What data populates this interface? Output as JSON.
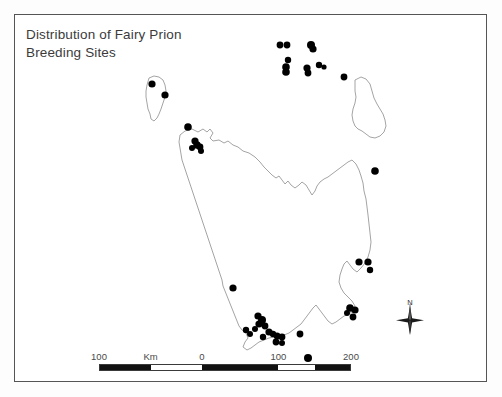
{
  "figure": {
    "title": "Distribution of Fairy Prion\nBreeding Sites",
    "title_line_1": "Distribution of Fairy Prion",
    "title_line_2": "Breeding Sites",
    "frame_color": "#555555",
    "background_color": "#ffffff",
    "coastline_color": "#8d8d8d",
    "site_marker_color": "#000000"
  },
  "scale_bar": {
    "unit_label": "Km",
    "labels": [
      {
        "text": "100",
        "x_pct": 0
      },
      {
        "text": "Km",
        "x_pct": 20.5
      },
      {
        "text": "0",
        "x_pct": 40.8
      },
      {
        "text": "100",
        "x_pct": 71.2
      },
      {
        "text": "200",
        "x_pct": 100
      }
    ],
    "segments": [
      {
        "start_pct": 0,
        "end_pct": 20.5,
        "filled": true
      },
      {
        "start_pct": 20.5,
        "end_pct": 40.8,
        "filled": false
      },
      {
        "start_pct": 40.8,
        "end_pct": 71.2,
        "filled": true
      },
      {
        "start_pct": 71.2,
        "end_pct": 86.0,
        "filled": false
      },
      {
        "start_pct": 86.0,
        "end_pct": 100,
        "filled": true
      }
    ]
  },
  "north_arrow": {
    "label": "N"
  },
  "map": {
    "region": "Tasmania",
    "coastlines": [
      {
        "name": "tasmania-mainland",
        "path": "M 166 121 L 171 117 L 178 115 L 184 118 L 189 115 L 193 118 L 196 115 L 199 119 L 196 124 L 199 127 L 205 126 L 210 129 L 214 127 L 219 131 L 224 133 L 229 137 L 235 139 L 241 143 L 246 148 L 250 153 L 254 157 L 258 161 L 262 164 L 265 162 L 268 166 L 271 170 L 274 167 L 277 171 L 281 174 L 285 171 L 288 168 L 292 171 L 295 176 L 298 181 L 301 177 L 303 172 L 306 168 L 310 165 L 314 163 L 318 160 L 322 157 L 326 154 L 330 151 L 334 148 L 338 146 L 342 150 L 345 156 L 347 162 L 349 169 L 350 177 L 352 185 L 353 193 L 354 201 L 355 210 L 356 219 L 357 228 L 356 236 L 354 243 L 351 249 L 347 254 L 343 258 L 339 255 L 336 251 L 333 247 L 330 250 L 328 255 L 326 261 L 325 268 L 327 274 L 330 279 L 334 283 L 338 287 L 341 292 L 339 297 L 335 300 L 330 302 L 326 305 L 322 308 L 318 310 L 314 307 L 311 303 L 308 299 L 305 295 L 302 291 L 299 294 L 296 298 L 293 302 L 290 306 L 287 310 L 283 313 L 279 316 L 275 319 L 270 321 L 265 322 L 260 323 L 255 324 L 250 326 L 245 328 L 241 331 L 237 334 L 233 336 L 229 333 L 231 328 L 234 324 L 232 319 L 228 316 L 225 312 L 223 307 L 221 302 L 219 297 L 217 292 L 215 287 L 213 282 L 211 277 L 209 272 L 208 266 L 206 260 L 204 254 L 202 248 L 200 242 L 198 236 L 196 230 L 194 224 L 192 218 L 190 212 L 188 206 L 186 200 L 184 194 L 182 188 L 180 182 L 178 176 L 176 170 L 174 164 L 172 158 L 170 152 L 168 146 L 167 140 L 166 134 L 165 128 Z"
      },
      {
        "name": "king-island",
        "path": "M 135 64 L 140 62 L 145 63 L 149 66 L 151 71 L 152 77 L 151 83 L 149 89 L 147 95 L 145 100 L 143 104 L 140 107 L 137 105 L 136 100 L 134 95 L 133 89 L 132 83 L 132 77 L 133 71 Z"
      },
      {
        "name": "flinders-island",
        "path": "M 341 66 L 347 63 L 352 65 L 356 70 L 358 77 L 360 84 L 363 90 L 366 95 L 369 100 L 371 106 L 372 112 L 370 118 L 366 122 L 361 124 L 356 123 L 352 120 L 348 117 L 344 115 L 341 112 L 339 107 L 338 101 L 339 95 L 341 89 L 342 83 L 341 77 Z"
      }
    ],
    "breeding_sites": [
      {
        "x": 138,
        "y": 70,
        "r": 3.6,
        "area": "king-island-north"
      },
      {
        "x": 151,
        "y": 81,
        "r": 3.6,
        "area": "king-island-east"
      },
      {
        "x": 266,
        "y": 31,
        "r": 3.4,
        "area": "hunter-group"
      },
      {
        "x": 273,
        "y": 31,
        "r": 3.4,
        "area": "hunter-group"
      },
      {
        "x": 297,
        "y": 31,
        "r": 4.0,
        "area": "three-hummock"
      },
      {
        "x": 299,
        "y": 35,
        "r": 3.6,
        "area": "three-hummock"
      },
      {
        "x": 274,
        "y": 46,
        "r": 3.2,
        "area": "bass-strait-central"
      },
      {
        "x": 272,
        "y": 53,
        "r": 3.8,
        "area": "bass-strait-central"
      },
      {
        "x": 272,
        "y": 58,
        "r": 3.8,
        "area": "bass-strait-central"
      },
      {
        "x": 293,
        "y": 54,
        "r": 3.6,
        "area": "bass-strait-central"
      },
      {
        "x": 294,
        "y": 59,
        "r": 3.4,
        "area": "bass-strait-central"
      },
      {
        "x": 305,
        "y": 51,
        "r": 3.2,
        "area": "bass-strait-east"
      },
      {
        "x": 310,
        "y": 53,
        "r": 2.6,
        "area": "bass-strait-east"
      },
      {
        "x": 330,
        "y": 63,
        "r": 3.4,
        "area": "flinders-northwest"
      },
      {
        "x": 174,
        "y": 113,
        "r": 3.8,
        "area": "northwest-coast"
      },
      {
        "x": 181,
        "y": 127,
        "r": 3.6,
        "area": "northwest-coast"
      },
      {
        "x": 183,
        "y": 131,
        "r": 3.8,
        "area": "northwest-coast"
      },
      {
        "x": 186,
        "y": 133,
        "r": 3.4,
        "area": "northwest-coast"
      },
      {
        "x": 178,
        "y": 134,
        "r": 3.0,
        "area": "northwest-coast"
      },
      {
        "x": 187,
        "y": 137,
        "r": 3.0,
        "area": "northwest-coast"
      },
      {
        "x": 361,
        "y": 157,
        "r": 3.8,
        "area": "east-coast-north"
      },
      {
        "x": 219,
        "y": 274,
        "r": 3.6,
        "area": "southwest-coast"
      },
      {
        "x": 345,
        "y": 248,
        "r": 3.6,
        "area": "southeast-coast"
      },
      {
        "x": 354,
        "y": 248,
        "r": 3.6,
        "area": "southeast-coast"
      },
      {
        "x": 356,
        "y": 256,
        "r": 3.2,
        "area": "southeast-coast"
      },
      {
        "x": 244,
        "y": 302,
        "r": 3.6,
        "area": "far-south-cluster"
      },
      {
        "x": 248,
        "y": 306,
        "r": 4.0,
        "area": "far-south-cluster"
      },
      {
        "x": 245,
        "y": 310,
        "r": 3.6,
        "area": "far-south-cluster"
      },
      {
        "x": 251,
        "y": 312,
        "r": 3.4,
        "area": "far-south-cluster"
      },
      {
        "x": 241,
        "y": 315,
        "r": 3.0,
        "area": "far-south-cluster"
      },
      {
        "x": 255,
        "y": 318,
        "r": 3.6,
        "area": "far-south-cluster"
      },
      {
        "x": 259,
        "y": 320,
        "r": 3.2,
        "area": "far-south-cluster"
      },
      {
        "x": 263,
        "y": 322,
        "r": 3.4,
        "area": "far-south-cluster"
      },
      {
        "x": 268,
        "y": 323,
        "r": 3.4,
        "area": "far-south-cluster"
      },
      {
        "x": 262,
        "y": 328,
        "r": 3.4,
        "area": "far-south-cluster"
      },
      {
        "x": 268,
        "y": 329,
        "r": 3.0,
        "area": "far-south-cluster"
      },
      {
        "x": 249,
        "y": 323,
        "r": 3.2,
        "area": "far-south-cluster"
      },
      {
        "x": 232,
        "y": 316,
        "r": 3.2,
        "area": "far-south-cluster"
      },
      {
        "x": 236,
        "y": 320,
        "r": 3.0,
        "area": "far-south-cluster"
      },
      {
        "x": 286,
        "y": 320,
        "r": 3.4,
        "area": "bruny-south"
      },
      {
        "x": 294,
        "y": 344,
        "r": 4.0,
        "area": "maatsuyker"
      },
      {
        "x": 336,
        "y": 294,
        "r": 3.8,
        "area": "southeast-islands"
      },
      {
        "x": 341,
        "y": 296,
        "r": 3.6,
        "area": "southeast-islands"
      },
      {
        "x": 339,
        "y": 303,
        "r": 3.4,
        "area": "southeast-islands"
      },
      {
        "x": 333,
        "y": 299,
        "r": 3.0,
        "area": "southeast-islands"
      }
    ]
  }
}
